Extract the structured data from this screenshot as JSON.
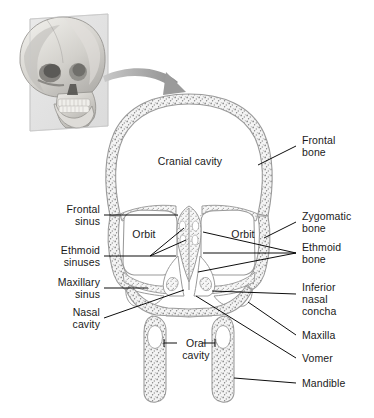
{
  "figure": {
    "type": "anatomical-illustration",
    "background_color": "#ffffff",
    "text_color": "#1a1a1a",
    "leader_line_color": "#000000",
    "bone_outline_color": "#9a9a9a",
    "bone_fill_color": "#f2f2f2",
    "stipple_color": "#8a8a8a",
    "arrow_color": "#9b9b9b",
    "inset_plane_color": "#dcdcdc"
  },
  "inset": {
    "name": "skull-photo-inset",
    "description": "Grayscale three-quarter view photograph of a human skull with a translucent coronal cutting plane"
  },
  "arrow": {
    "name": "pointer-arrow",
    "description": "Curved gray arrow pointing from the inset skull to the coronal section"
  },
  "interior_labels": [
    {
      "id": "cranial-cavity",
      "text": "Cranial cavity",
      "x": 190,
      "y": 161,
      "align": "mid"
    },
    {
      "id": "orbit-left",
      "text": "Orbit",
      "x": 144,
      "y": 234,
      "align": "mid"
    },
    {
      "id": "orbit-right",
      "text": "Orbit",
      "x": 243,
      "y": 234,
      "align": "mid"
    },
    {
      "id": "oral-cavity",
      "text": "Oral\ncavity",
      "x": 196,
      "y": 345,
      "align": "mid"
    }
  ],
  "left_labels": [
    {
      "id": "frontal-sinus",
      "text": "Frontal\nsinus",
      "x": 100,
      "y": 209
    },
    {
      "id": "ethmoid-sinuses",
      "text": "Ethmoid\nsinuses",
      "x": 100,
      "y": 251
    },
    {
      "id": "maxillary-sinus",
      "text": "Maxillary\nsinus",
      "x": 100,
      "y": 282
    },
    {
      "id": "nasal-cavity",
      "text": "Nasal\ncavity",
      "x": 100,
      "y": 313
    }
  ],
  "right_labels": [
    {
      "id": "frontal-bone",
      "text": "Frontal\nbone",
      "x": 309,
      "y": 140
    },
    {
      "id": "zygomatic-bone",
      "text": "Zygomatic\nbone",
      "x": 309,
      "y": 217
    },
    {
      "id": "ethmoid-bone",
      "text": "Ethmoid\nbone",
      "x": 309,
      "y": 248
    },
    {
      "id": "inferior-nasal-concha",
      "text": "Inferior\nnasal\nconcha",
      "x": 309,
      "y": 288
    },
    {
      "id": "maxilla",
      "text": "Maxilla",
      "x": 309,
      "y": 331
    },
    {
      "id": "vomer",
      "text": "Vomer",
      "x": 309,
      "y": 354
    },
    {
      "id": "mandible",
      "text": "Mandible",
      "x": 309,
      "y": 379
    }
  ]
}
